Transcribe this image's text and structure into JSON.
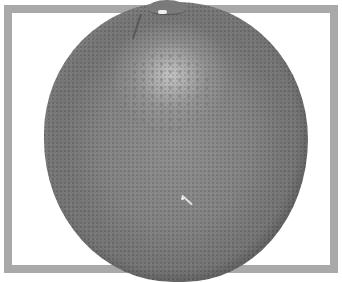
{
  "image": {
    "subject": "Grapefruit",
    "style": "Grayscale photograph",
    "frame": {
      "shape": "rectangle",
      "color": "#a9a9a9",
      "thickness_px": 8
    },
    "colors": {
      "background": "#ffffff",
      "fruit_base": "#858585",
      "fruit_highlight": "#cdcdcd",
      "fruit_edge": "#767676"
    },
    "features": [
      "stem-end",
      "highlight",
      "pitted-peel-texture",
      "small-scratch"
    ]
  }
}
